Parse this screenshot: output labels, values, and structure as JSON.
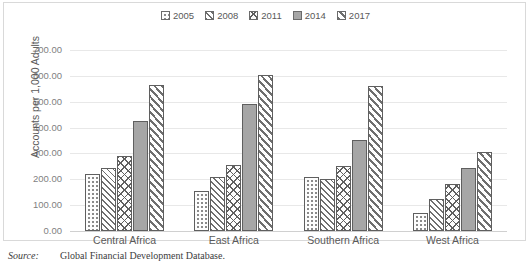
{
  "chart_data": {
    "type": "bar",
    "title": "",
    "xlabel": "",
    "ylabel": "Accounts per 1,000 Adults",
    "ylim": [
      0,
      700
    ],
    "ytick_step": 100,
    "ytick_labels": [
      "0.00",
      "100.00",
      "200.00",
      "300.00",
      "400.00",
      "500.00",
      "600.00",
      "700.00"
    ],
    "grid": true,
    "legend_position": "top-center",
    "categories": [
      "Central Africa",
      "East Africa",
      "Southern Africa",
      "West Africa"
    ],
    "series": [
      {
        "name": "2005",
        "pattern": "dots",
        "values": [
          220,
          155,
          210,
          70
        ]
      },
      {
        "name": "2008",
        "pattern": "diagonal",
        "values": [
          245,
          210,
          200,
          125
        ]
      },
      {
        "name": "2011",
        "pattern": "crosshatch",
        "values": [
          290,
          255,
          250,
          180
        ]
      },
      {
        "name": "2014",
        "pattern": "solid",
        "values": [
          425,
          490,
          352,
          243
        ]
      },
      {
        "name": "2017",
        "pattern": "wide-diagonal",
        "values": [
          565,
          605,
          560,
          305
        ]
      }
    ]
  },
  "legend": {
    "items": [
      {
        "label": "2005"
      },
      {
        "label": "2008"
      },
      {
        "label": "2011"
      },
      {
        "label": "2014"
      },
      {
        "label": "2017"
      }
    ]
  },
  "source": {
    "label": "Source:",
    "text": "Global Financial Development Database."
  },
  "colors": {
    "solid_fill": "#a6a6a6",
    "bar_border": "#5f5f5f",
    "gridline": "#e8e8e8",
    "frame": "#d9d9d9",
    "text": "#595959",
    "tick_text": "#7f7f7f"
  }
}
